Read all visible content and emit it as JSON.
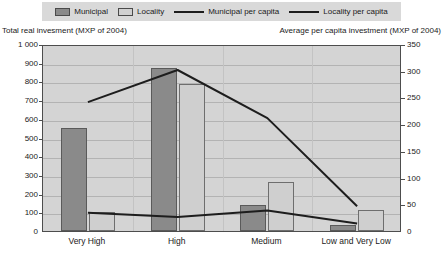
{
  "legend": {
    "items": [
      {
        "label": "Municipal",
        "type": "swatch",
        "color": "#8a8a8a",
        "icon": "legend-swatch-municipal"
      },
      {
        "label": "Locality",
        "type": "swatch",
        "color": "#d0d0d0",
        "icon": "legend-swatch-locality"
      },
      {
        "label": "Municipal per capita",
        "type": "line",
        "color": "#1d1d1d",
        "icon": "legend-line-municipal-per-capita"
      },
      {
        "label": "Locality per capita",
        "type": "line",
        "color": "#1d1d1d",
        "icon": "legend-line-locality-per-capita"
      }
    ]
  },
  "axis_captions": {
    "left": "Total real invesment (MXP of 2004)",
    "right": "Average per capita investment (MXP of 2004)"
  },
  "chart_data": {
    "type": "bar",
    "title": "",
    "subtitle": "",
    "xlabel": "",
    "ylabel": "Total real invesment (MXP of 2004)",
    "y2label": "Average per capita investment (MXP of 2004)",
    "grid": true,
    "legend_position": "top",
    "categories": [
      "Very High",
      "High",
      "Medium",
      "Low and Very Low"
    ],
    "ylim": [
      0,
      1000
    ],
    "y2lim": [
      0,
      350
    ],
    "yticks": [
      "0",
      "100",
      "200",
      "300",
      "400",
      "500",
      "600",
      "700",
      "800",
      "900",
      "1 000"
    ],
    "ytick_values": [
      0,
      100,
      200,
      300,
      400,
      500,
      600,
      700,
      800,
      900,
      1000
    ],
    "y2ticks": [
      "0",
      "50",
      "100",
      "150",
      "200",
      "250",
      "300",
      "350"
    ],
    "y2tick_values": [
      0,
      50,
      100,
      150,
      200,
      250,
      300,
      350
    ],
    "series": [
      {
        "name": "Municipal",
        "kind": "bar",
        "axis": "left",
        "color": "#8a8a8a",
        "values": [
          550,
          870,
          140,
          30
        ]
      },
      {
        "name": "Locality",
        "kind": "bar",
        "axis": "left",
        "color": "#cfcfcf",
        "values": [
          100,
          785,
          260,
          110
        ]
      },
      {
        "name": "Municipal per capita",
        "kind": "line",
        "axis": "right",
        "color": "#1d1d1d",
        "values": [
          245,
          305,
          215,
          50
        ]
      },
      {
        "name": "Locality per capita",
        "kind": "line",
        "axis": "right",
        "color": "#1d1d1d",
        "values": [
          38,
          30,
          42,
          18
        ]
      }
    ]
  }
}
